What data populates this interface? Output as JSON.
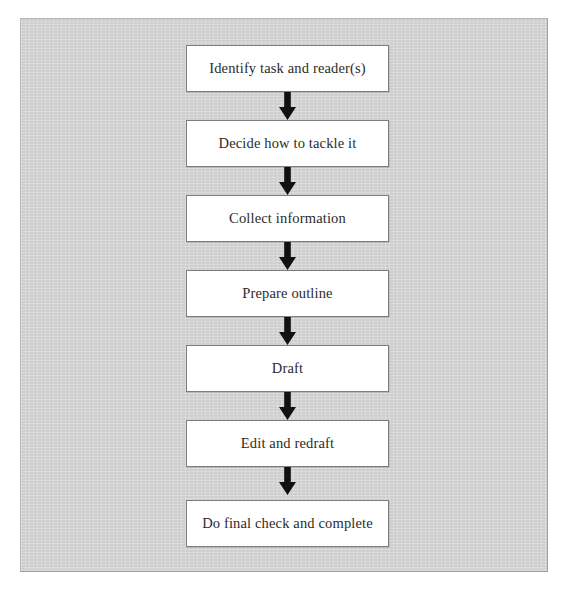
{
  "figure": {
    "type": "flowchart",
    "orientation": "vertical",
    "panel_color": "#d2d2d2",
    "box_fill_color": "#ffffff",
    "box_border_color": "#7d7d7d",
    "arrow_color": "#111111",
    "text_color": "#2b2b2b"
  },
  "nodes": [
    {
      "id": "identify",
      "label": "Identify task and reader(s)"
    },
    {
      "id": "decide",
      "label": "Decide how to tackle it"
    },
    {
      "id": "collect",
      "label": "Collect information"
    },
    {
      "id": "outline",
      "label": "Prepare outline"
    },
    {
      "id": "draft",
      "label": "Draft"
    },
    {
      "id": "edit",
      "label": "Edit and redraft"
    },
    {
      "id": "finalcheck",
      "label": "Do final check and complete"
    }
  ],
  "connectors": [
    {
      "from": "identify",
      "to": "decide",
      "icon": "down-arrow-icon"
    },
    {
      "from": "decide",
      "to": "collect",
      "icon": "down-arrow-icon"
    },
    {
      "from": "collect",
      "to": "outline",
      "icon": "down-arrow-icon"
    },
    {
      "from": "outline",
      "to": "draft",
      "icon": "down-arrow-icon"
    },
    {
      "from": "draft",
      "to": "edit",
      "icon": "down-arrow-icon"
    },
    {
      "from": "edit",
      "to": "finalcheck",
      "icon": "down-arrow-icon"
    }
  ]
}
